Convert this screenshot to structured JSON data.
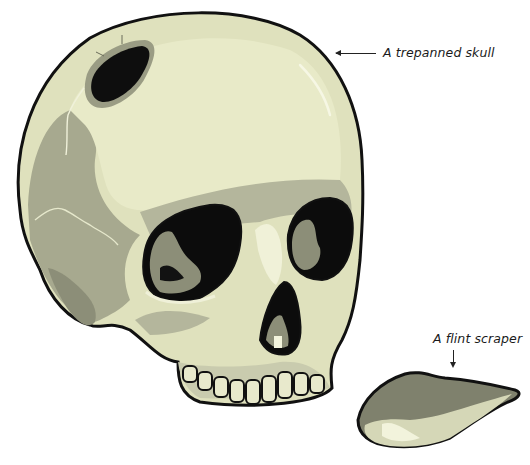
{
  "labels": {
    "skull": "A trepanned skull",
    "flint": "A flint scraper"
  },
  "colors": {
    "bone_light": "#e6e8c4",
    "bone_mid": "#c7c9ab",
    "bone_shadow": "#a0a28b",
    "bone_dark": "#7a7c6a",
    "outline": "#111111",
    "highlight": "#f4f5de",
    "background": "#ffffff"
  }
}
